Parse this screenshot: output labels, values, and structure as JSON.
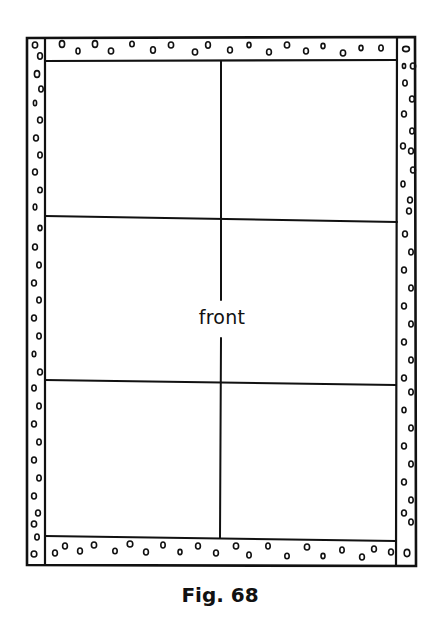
{
  "figure": {
    "caption": "Fig. 68",
    "center_label": "front",
    "colors": {
      "line": "#111111",
      "background": "#ffffff"
    }
  }
}
